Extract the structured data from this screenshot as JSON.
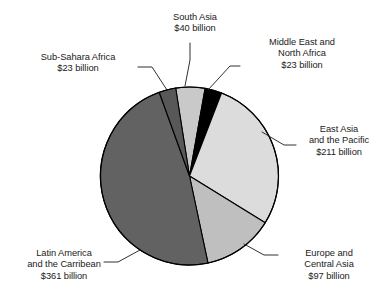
{
  "chart_data": {
    "type": "pie",
    "title": "",
    "subtitle": "",
    "unit": "billion US dollars",
    "currency_symbol": "$",
    "legend_position": "callouts",
    "grid": false,
    "total": 755,
    "categories": [
      "South Asia",
      "Middle East and North Africa",
      "East Asia and the Pacific",
      "Europe and Central Asia",
      "Latin America and the Carribean",
      "Sub-Sahara Africa"
    ],
    "values": [
      40,
      23,
      211,
      97,
      361,
      23
    ],
    "labels": [
      "$40 billion",
      "$23 billion",
      "$211 billion",
      "$97 billion",
      "$361 billion",
      "$23 billion"
    ],
    "colors": [
      "#c9c9c9",
      "#000000",
      "#dcdcdc",
      "#bfbfbf",
      "#626262",
      "#585858"
    ],
    "slices": [
      {
        "name": "south-asia",
        "category": "South Asia",
        "value": 40,
        "value_label": "$40 billion",
        "percent": 5.3,
        "color": "#c9c9c9",
        "start_angle": 351.0,
        "sweep_angle": 19.1
      },
      {
        "name": "middle-east-north-africa",
        "category": "Middle East and North Africa",
        "value": 23,
        "value_label": "$23 billion",
        "percent": 3.0,
        "color": "#000000",
        "start_angle": 10.1,
        "sweep_angle": 11.0
      },
      {
        "name": "east-asia-pacific",
        "category": "East Asia and the Pacific",
        "value": 211,
        "value_label": "$211 billion",
        "percent": 27.9,
        "color": "#dcdcdc",
        "start_angle": 21.1,
        "sweep_angle": 100.6
      },
      {
        "name": "europe-central-asia",
        "category": "Europe and Central Asia",
        "value": 97,
        "value_label": "$97 billion",
        "percent": 12.8,
        "color": "#bfbfbf",
        "start_angle": 121.7,
        "sweep_angle": 46.3
      },
      {
        "name": "latin-america-carribean",
        "category": "Latin America and the Carribean",
        "value": 361,
        "value_label": "$361 billion",
        "percent": 47.8,
        "color": "#626262",
        "start_angle": 168.0,
        "sweep_angle": 172.1
      },
      {
        "name": "sub-sahara-africa",
        "category": "Sub-Sahara Africa",
        "value": 23,
        "value_label": "$23 billion",
        "percent": 3.0,
        "color": "#585858",
        "start_angle": 340.1,
        "sweep_angle": 11.0
      }
    ]
  },
  "callouts": {
    "south_asia": {
      "line1": "South Asia",
      "line2": "$40 billion"
    },
    "middle_east": {
      "line1": "Middle East and",
      "line2": "North Africa",
      "line3": "$23 billion"
    },
    "sub_sahara": {
      "line1": "Sub-Sahara Africa",
      "line2": "$23 billion"
    },
    "east_asia": {
      "line1": "East Asia",
      "line2": "and the Pacific",
      "line3": "$211 billion"
    },
    "europe": {
      "line1": "Europe and",
      "line2": "Central Asia",
      "line3": "$97 billion"
    },
    "latin_america": {
      "line1": "Latin America",
      "line2": "and the Carribean",
      "line3": "$361 billion"
    }
  },
  "style": {
    "background": "#ffffff",
    "text_color": "#1a1a1a",
    "outline_color": "#000000",
    "leader_color": "#1a1a1a"
  }
}
